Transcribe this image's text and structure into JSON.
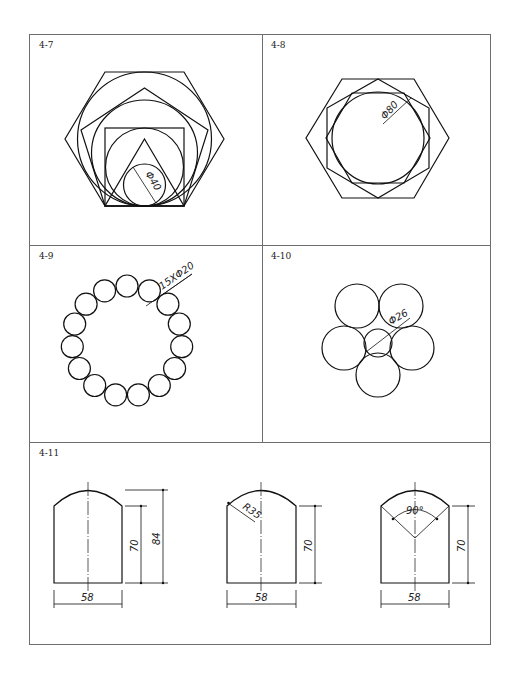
{
  "figures": [
    {
      "id": "4-7",
      "label": "4-7",
      "dimension": "Φ40"
    },
    {
      "id": "4-8",
      "label": "4-8",
      "dimension": "Φ80"
    },
    {
      "id": "4-9",
      "label": "4-9",
      "dimension": "15XΦ20",
      "circle_count": 15
    },
    {
      "id": "4-10",
      "label": "4-10",
      "dimension": "Φ26"
    },
    {
      "id": "4-11",
      "label": "4-11",
      "shapes": [
        {
          "width_dim": "58",
          "height_dim": "70",
          "total_height_dim": "84"
        },
        {
          "width_dim": "58",
          "height_dim": "70",
          "radius_dim": "R35"
        },
        {
          "width_dim": "58",
          "height_dim": "70",
          "angle_dim": "90°"
        }
      ]
    }
  ],
  "colors": {
    "line": "#111111",
    "frame": "#6e6e6e",
    "background": "#ffffff"
  }
}
